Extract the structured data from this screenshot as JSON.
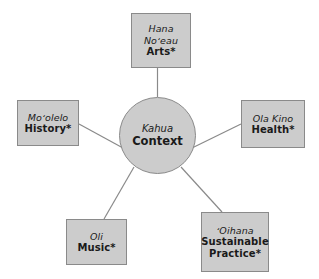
{
  "diagram": {
    "type": "hub-and-spoke",
    "colors": {
      "node_fill": "#cccccc",
      "node_border": "#8a8a8a",
      "connector": "#8a8a8a",
      "background": "#ffffff",
      "text": "#1a1a1a"
    },
    "hub": {
      "id": "context",
      "hawaiian": "Kahua",
      "english": "Context"
    },
    "nodes": [
      {
        "id": "arts",
        "hawaiian_line1": "Hana",
        "hawaiian_line2": "Noʻeau",
        "english": "Arts*",
        "position": "top"
      },
      {
        "id": "history",
        "hawaiian_line1": "Moʻolelo",
        "hawaiian_line2": "",
        "english": "History*",
        "position": "left"
      },
      {
        "id": "health",
        "hawaiian_line1": "Ola Kino",
        "hawaiian_line2": "",
        "english": "Health*",
        "position": "right"
      },
      {
        "id": "music",
        "hawaiian_line1": "Oli",
        "hawaiian_line2": "",
        "english": "Music*",
        "position": "bottom-left"
      },
      {
        "id": "practice",
        "hawaiian_line1": "ʻOihana",
        "hawaiian_line2": "",
        "english_line1": "Sustainable",
        "english_line2": "Practice*",
        "position": "bottom-right"
      }
    ]
  }
}
